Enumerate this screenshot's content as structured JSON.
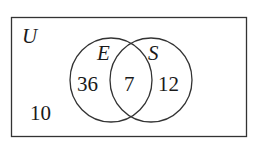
{
  "diagram": {
    "type": "venn",
    "universe": {
      "label": "U",
      "outside_count": "10"
    },
    "sets": [
      {
        "label": "E",
        "only_count": "36"
      },
      {
        "label": "S",
        "only_count": "12"
      }
    ],
    "intersection": {
      "sets": [
        "E",
        "S"
      ],
      "count": "7"
    },
    "colors": {
      "stroke": "#333333",
      "text": "#1a1a1a",
      "background": "#ffffff"
    }
  }
}
